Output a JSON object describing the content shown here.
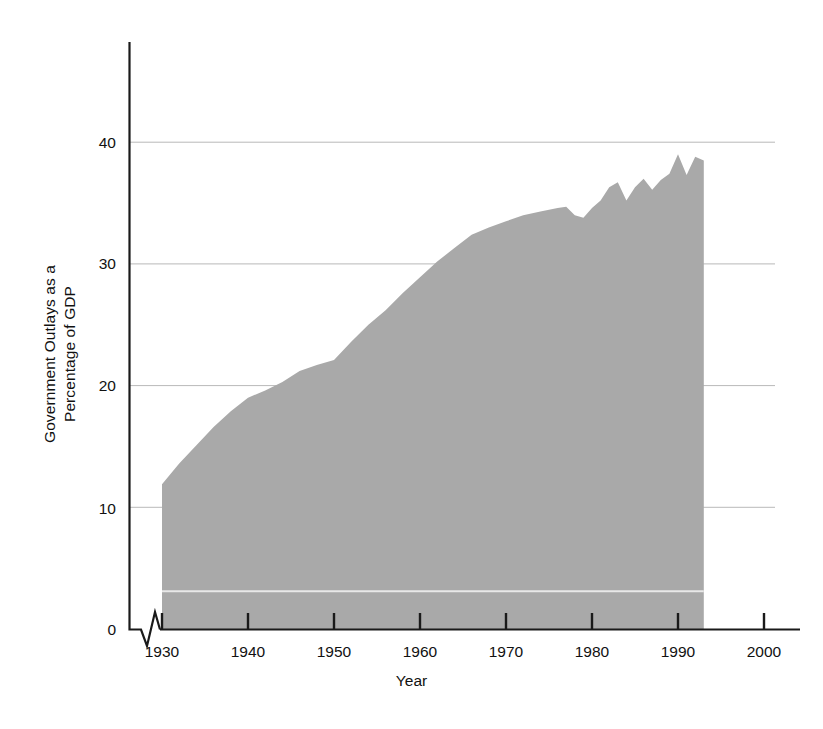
{
  "chart_data": {
    "type": "area",
    "title": "",
    "xlabel": "Year",
    "ylabel": "Government Outlays as a\nPercentage of GDP",
    "ylabel_line1": "Government Outlays as a",
    "ylabel_line2": "Percentage of GDP",
    "xlim": [
      1928,
      2004
    ],
    "ylim": [
      0,
      46
    ],
    "xticks": [
      1930,
      1940,
      1950,
      1960,
      1970,
      1980,
      1990,
      2000
    ],
    "xtick_labels": [
      "1930",
      "1940",
      "1950",
      "1960",
      "1970",
      "1980",
      "1990",
      "2000"
    ],
    "yticks": [
      0,
      10,
      20,
      30,
      40
    ],
    "ytick_labels": [
      "0",
      "10",
      "20",
      "30",
      "40"
    ],
    "gridlines_y": [
      10,
      20,
      30,
      40
    ],
    "grid": true,
    "axis_break_x": true,
    "series": [
      {
        "name": "Government Outlays as a Percentage of GDP",
        "fill_color": "#a9a9a9",
        "x": [
          1930,
          1932,
          1934,
          1936,
          1938,
          1940,
          1942,
          1944,
          1946,
          1948,
          1950,
          1952,
          1954,
          1956,
          1958,
          1960,
          1962,
          1964,
          1966,
          1968,
          1970,
          1972,
          1974,
          1976,
          1977,
          1978,
          1979,
          1980,
          1981,
          1982,
          1983,
          1984,
          1985,
          1986,
          1987,
          1988,
          1989,
          1990,
          1991,
          1992,
          1993
        ],
        "values": [
          11.9,
          13.6,
          15.1,
          16.6,
          17.9,
          19.0,
          19.6,
          20.3,
          21.2,
          21.7,
          22.1,
          23.6,
          25.0,
          26.2,
          27.6,
          28.9,
          30.2,
          31.3,
          32.4,
          33.0,
          33.5,
          34.0,
          34.3,
          34.6,
          34.7,
          34.0,
          33.8,
          34.6,
          35.2,
          36.3,
          36.7,
          35.2,
          36.3,
          37.0,
          36.1,
          36.9,
          37.4,
          39.0,
          37.3,
          38.8,
          38.5
        ]
      }
    ],
    "inner_reference_line": {
      "value": 3.1,
      "color": "#e8e8e8",
      "label": ""
    },
    "data_end_year": 1993
  },
  "layout": {
    "background": "#ffffff",
    "axis_color": "#1a1a1a",
    "grid_color": "#b9b9b9",
    "tick_font_px": 15.5
  }
}
